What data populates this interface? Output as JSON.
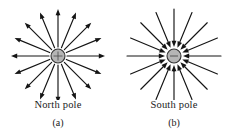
{
  "figure": {
    "background_color": "#ffffff",
    "width": 232,
    "height": 135,
    "ink_color": "#141414",
    "pole_fill_color": "#b5b5b5",
    "pole_stroke_color": "#333333"
  },
  "panels": [
    {
      "id": "a",
      "pole_label": "North pole",
      "sub_label": "(a)",
      "field_direction": "outward",
      "arrow_count": 16,
      "center": {
        "x": 58,
        "y": 56
      },
      "pole_radius": 7,
      "arrow_inner_radius": 9,
      "arrow_outer_radius": 47
    },
    {
      "id": "b",
      "pole_label": "South pole",
      "sub_label": "(b)",
      "field_direction": "inward",
      "arrow_count": 16,
      "center": {
        "x": 58,
        "y": 56
      },
      "pole_radius": 7,
      "arrow_inner_radius": 9,
      "arrow_outer_radius": 47
    }
  ]
}
